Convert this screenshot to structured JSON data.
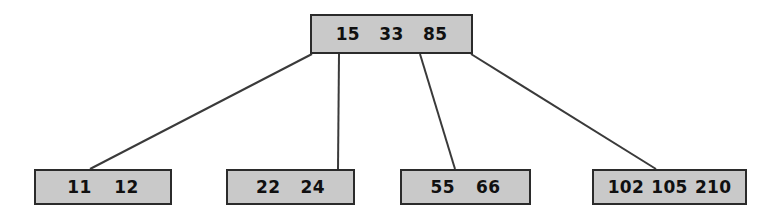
{
  "diagram": {
    "kind": "b-tree",
    "colors": {
      "node_fill": "#c9c9c9",
      "node_border": "#2b2b2b",
      "edge": "#3a3a3a",
      "text": "#101010",
      "background": "#ffffff"
    },
    "root": {
      "id": "root",
      "keys": [
        "15",
        "33",
        "85"
      ]
    },
    "leaves": [
      {
        "id": "leaf-0",
        "keys": [
          "11",
          "12"
        ]
      },
      {
        "id": "leaf-1",
        "keys": [
          "22",
          "24"
        ]
      },
      {
        "id": "leaf-2",
        "keys": [
          "55",
          "66"
        ]
      },
      {
        "id": "leaf-3",
        "keys": [
          "102",
          "105",
          "210"
        ]
      }
    ],
    "edges": [
      {
        "id": "edge-root-leaf-0",
        "from": "root",
        "to": "leaf-0",
        "x1": 312,
        "y1": 54,
        "x2": 90,
        "y2": 169
      },
      {
        "id": "edge-root-leaf-1",
        "from": "root",
        "to": "leaf-1",
        "x1": 339,
        "y1": 54,
        "x2": 338,
        "y2": 169
      },
      {
        "id": "edge-root-leaf-2",
        "from": "root",
        "to": "leaf-2",
        "x1": 420,
        "y1": 54,
        "x2": 455,
        "y2": 169
      },
      {
        "id": "edge-root-leaf-3",
        "from": "root",
        "to": "leaf-3",
        "x1": 471,
        "y1": 54,
        "x2": 656,
        "y2": 169
      }
    ]
  }
}
